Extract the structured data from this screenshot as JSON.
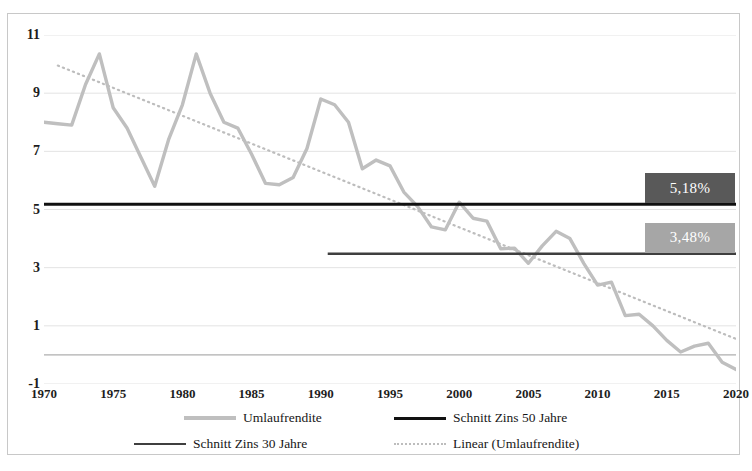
{
  "chart_data": {
    "type": "line",
    "title": "",
    "xlabel": "",
    "ylabel": "",
    "xlim": [
      1970,
      2020
    ],
    "ylim": [
      -1,
      11
    ],
    "ytick_labels": [
      "11",
      "9",
      "7",
      "5",
      "3",
      "1",
      "-1"
    ],
    "ytick_values": [
      11,
      9,
      7,
      5,
      3,
      1,
      -1
    ],
    "xtick_labels": [
      "1970",
      "1975",
      "1980",
      "1985",
      "1990",
      "1995",
      "2000",
      "2005",
      "2010",
      "2015",
      "2020"
    ],
    "xtick_values": [
      1970,
      1975,
      1980,
      1985,
      1990,
      1995,
      2000,
      2005,
      2010,
      2015,
      2020
    ],
    "grid": true,
    "legend_position": "bottom",
    "series": [
      {
        "name": "Umlaufrendite",
        "type": "line",
        "color": "#bfbfbf",
        "x": [
          1970,
          1971,
          1972,
          1973,
          1974,
          1975,
          1976,
          1977,
          1978,
          1979,
          1980,
          1981,
          1982,
          1983,
          1984,
          1985,
          1986,
          1987,
          1988,
          1989,
          1990,
          1991,
          1992,
          1993,
          1994,
          1995,
          1996,
          1997,
          1998,
          1999,
          2000,
          2001,
          2002,
          2003,
          2004,
          2005,
          2006,
          2007,
          2008,
          2009,
          2010,
          2011,
          2012,
          2013,
          2014,
          2015,
          2016,
          2017,
          2018,
          2019,
          2020
        ],
        "values": [
          8.0,
          7.95,
          7.9,
          9.3,
          10.35,
          8.5,
          7.8,
          6.8,
          5.8,
          7.4,
          8.6,
          10.35,
          9.0,
          8.0,
          7.8,
          6.9,
          5.9,
          5.85,
          6.1,
          7.1,
          8.8,
          8.6,
          8.0,
          6.4,
          6.7,
          6.5,
          5.6,
          5.1,
          4.4,
          4.3,
          5.25,
          4.7,
          4.6,
          3.65,
          3.67,
          3.15,
          3.75,
          4.25,
          4.0,
          3.15,
          2.4,
          2.5,
          1.35,
          1.4,
          1.0,
          0.5,
          0.1,
          0.3,
          0.4,
          -0.25,
          -0.5
        ]
      },
      {
        "name": "Schnitt Zins 50 Jahre",
        "type": "hline",
        "color": "#111111",
        "value": 5.18,
        "x_start": 1970,
        "x_end": 2020,
        "label": "5,18%"
      },
      {
        "name": "Schnitt Zins 30 Jahre",
        "type": "hline",
        "color": "#3f3f3f",
        "value": 3.48,
        "x_start": 1990.5,
        "x_end": 2020,
        "label": "3,48%"
      },
      {
        "name": "Linear (Umlaufrendite)",
        "type": "trendline",
        "style": "dotted",
        "color": "#bdbdbd",
        "x_start": 1971,
        "x_end": 2020,
        "y_start": 9.95,
        "y_end": 0.55
      }
    ]
  },
  "labels": {
    "avg50": "5,18%",
    "avg30": "3,48%"
  },
  "legend": {
    "items": [
      {
        "label": "Umlaufrendite",
        "swatch": "line-thick-gray"
      },
      {
        "label": "Schnitt Zins 50 Jahre",
        "swatch": "line-thick-black"
      },
      {
        "label": "Schnitt Zins 30 Jahre",
        "swatch": "line-thin-darkgray"
      },
      {
        "label": "Linear (Umlaufrendite)",
        "swatch": "line-dotted-gray"
      }
    ]
  },
  "colors": {
    "series_umlaufrendite": "#bfbfbf",
    "series_zins50": "#111111",
    "series_zins30": "#3f3f3f",
    "trendline": "#bdbdbd",
    "callout_50_bg": "#595959",
    "callout_30_bg": "#a6a6a6",
    "grid": "#e3e3e3",
    "axis": "#9a9a9a",
    "frame": "#c8c8c8"
  }
}
